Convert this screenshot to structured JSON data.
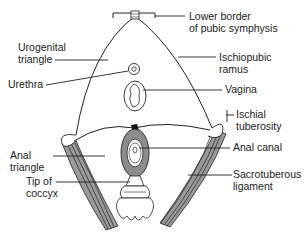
{
  "diagram": {
    "labels": {
      "lower_border_line1": "Lower border",
      "lower_border_line2": "of pubic symphysis",
      "urogenital_line1": "Urogenital",
      "urogenital_line2": "triangle",
      "ischiopubic_line1": "Ischiopubic",
      "ischiopubic_line2": "ramus",
      "urethra": "Urethra",
      "vagina": "Vagina",
      "ischial_line1": "Ischial",
      "ischial_line2": "tuberosity",
      "anal_triangle_line1": "Anal",
      "anal_triangle_line2": "triangle",
      "anal_canal": "Anal canal",
      "tip_coccyx_line1": "Tip of",
      "tip_coccyx_line2": "coccyx",
      "sacrotuberous_line1": "Sacrotuberous",
      "sacrotuberous_line2": "ligament"
    },
    "colors": {
      "line": "#222222",
      "ligament_fill": "#9a9a9a",
      "sphincter_fill": "#8c8c8c",
      "background": "#ffffff"
    }
  }
}
